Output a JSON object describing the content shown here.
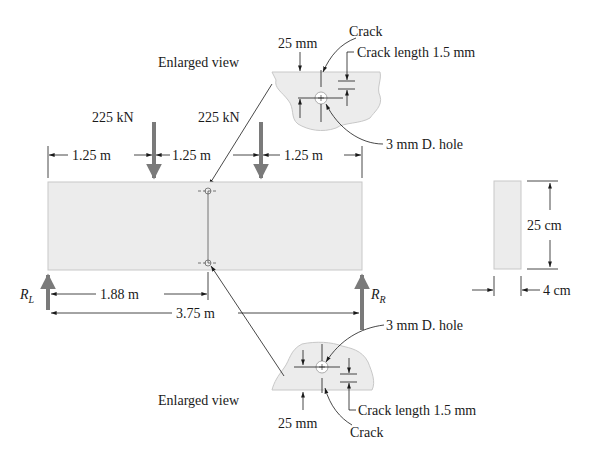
{
  "colors": {
    "beam_fill": "#ececec",
    "beam_edge": "#c8c8c8",
    "load_arrow": "#7a7a7a",
    "line": "#1a1a1a"
  },
  "loads": {
    "left_load": "225 kN",
    "right_load": "225 kN"
  },
  "dimensions": {
    "span_1": "1.25 m",
    "span_2": "1.25 m",
    "span_3": "1.25 m",
    "hole_position": "1.88 m",
    "total_length": "3.75 m",
    "section_height": "25 cm",
    "section_width": "4 cm"
  },
  "reactions": {
    "left": {
      "symbol": "R",
      "subscript": "L"
    },
    "right": {
      "symbol": "R",
      "subscript": "R"
    }
  },
  "top_detail": {
    "title": "Enlarged view",
    "edge_distance": "25 mm",
    "crack_label": "Crack",
    "crack_length_label": "Crack length 1.5 mm",
    "hole_label": "3 mm D. hole"
  },
  "bottom_detail": {
    "title": "Enlarged view",
    "edge_distance": "25 mm",
    "crack_label": "Crack",
    "crack_length_label": "Crack length 1.5 mm",
    "hole_label": "3 mm D. hole"
  }
}
